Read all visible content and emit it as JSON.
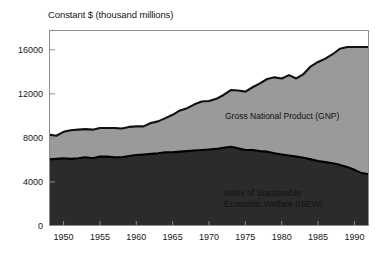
{
  "figure": {
    "axis_title": "Constant $ (thousand millions)"
  },
  "chart_data": {
    "type": "area",
    "title": "Constant $ (thousand millions)",
    "xlabel": "",
    "ylabel": "Constant $ (thousand millions)",
    "xlim": [
      1948,
      1992
    ],
    "ylim": [
      0,
      17800
    ],
    "grid": false,
    "legend_position": "inline-annotation",
    "stacked": false,
    "yticks": [
      0,
      4000,
      8000,
      12000,
      16000
    ],
    "ytick_labels": [
      "0",
      "4000",
      "8000",
      "12000",
      "16000"
    ],
    "xticks": [
      1950,
      1955,
      1960,
      1965,
      1970,
      1975,
      1980,
      1985,
      1990
    ],
    "xtick_labels": [
      "1950",
      "1955",
      "1960",
      "1965",
      "1970",
      "1975",
      "1980",
      "1985",
      "1990"
    ],
    "x": [
      1948,
      1949,
      1950,
      1951,
      1952,
      1953,
      1954,
      1955,
      1956,
      1957,
      1958,
      1959,
      1960,
      1961,
      1962,
      1963,
      1964,
      1965,
      1966,
      1967,
      1968,
      1969,
      1970,
      1971,
      1972,
      1973,
      1974,
      1975,
      1976,
      1977,
      1978,
      1979,
      1980,
      1981,
      1982,
      1983,
      1984,
      1985,
      1986,
      1987,
      1988,
      1989,
      1990,
      1991,
      1992
    ],
    "series": [
      {
        "name": "Gross National Product (GNP)",
        "label": "Gross National Product (GNP)",
        "color": "#9a9a9a",
        "line_color": "#111111",
        "values": [
          8300,
          8200,
          8550,
          8700,
          8750,
          8800,
          8750,
          8900,
          8900,
          8900,
          8850,
          9000,
          9050,
          9050,
          9350,
          9500,
          9800,
          10100,
          10500,
          10700,
          11050,
          11300,
          11350,
          11550,
          11900,
          12350,
          12300,
          12200,
          12600,
          12950,
          13350,
          13500,
          13400,
          13700,
          13400,
          13800,
          14500,
          14900,
          15200,
          15600,
          16100,
          16250,
          16250,
          16250,
          16250
        ]
      },
      {
        "name": "Index of Sustainable Economic Welfare (ISEW)",
        "label_line1": "Index of Sustainable",
        "label_line2": "Economic Welfare (ISEW)",
        "color": "#2b2b2b",
        "line_color": "#000000",
        "values": [
          6050,
          6100,
          6150,
          6100,
          6150,
          6250,
          6150,
          6300,
          6300,
          6250,
          6250,
          6350,
          6450,
          6500,
          6550,
          6600,
          6700,
          6700,
          6750,
          6800,
          6850,
          6900,
          6950,
          7000,
          7100,
          7200,
          7050,
          6900,
          6900,
          6800,
          6750,
          6600,
          6500,
          6400,
          6300,
          6200,
          6050,
          5900,
          5800,
          5700,
          5550,
          5350,
          5100,
          4800,
          4700
        ]
      }
    ],
    "annotations": [
      {
        "text": "Gross National Product (GNP)",
        "x": 1979,
        "y": 10700
      },
      {
        "text": "Index of Sustainable Economic Welfare (ISEW)",
        "x": 1979,
        "y": 3600
      }
    ]
  }
}
